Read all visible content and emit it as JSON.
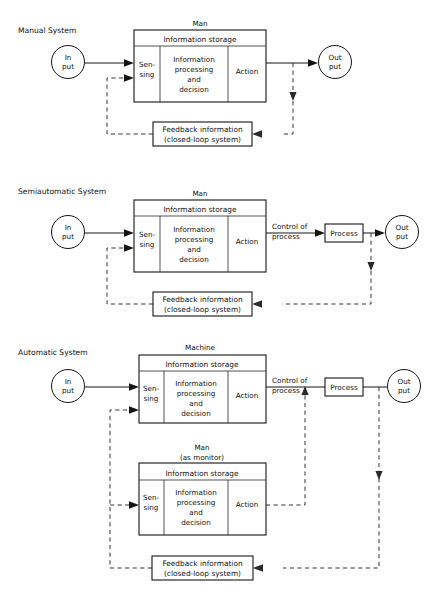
{
  "figure": {
    "title_visible": false,
    "labels": {
      "information_storage": "Information storage",
      "sensing": "Sen-\nsing",
      "sensing_line1": "Sen-",
      "sensing_line2": "sing",
      "processing_line1": "Information",
      "processing_line2": "processing",
      "processing_line3": "and",
      "processing_line4": "decision",
      "action": "Action",
      "input_line1": "In",
      "input_line2": "put",
      "output_line1": "Out",
      "output_line2": "put",
      "feedback_line1": "Feedback information",
      "feedback_line2": "(closed-loop system)",
      "control_line1": "Control of",
      "control_line2": "process",
      "process": "Process"
    }
  },
  "diagrams": [
    {
      "id": "manual-system",
      "system_label": "Manual System",
      "owner_label": "Man",
      "owner_sub_label": "",
      "storage_label": "Information storage",
      "cells": [
        {
          "id": "sensing",
          "lines": [
            "Sen-",
            "sing"
          ]
        },
        {
          "id": "processing",
          "lines": [
            "Information",
            "processing",
            "and",
            "decision"
          ]
        },
        {
          "id": "action",
          "lines": [
            "Action"
          ]
        }
      ],
      "input_node": {
        "lines": [
          "In",
          "put"
        ]
      },
      "output_node": {
        "lines": [
          "Out",
          "put"
        ]
      },
      "feedback_box": {
        "lines": [
          "Feedback information",
          "(closed-loop system)"
        ]
      },
      "has_process_block": false,
      "has_control_label": false,
      "has_monitor_block": false
    },
    {
      "id": "semiautomatic-system",
      "system_label": "Semiautomatic System",
      "owner_label": "Man",
      "owner_sub_label": "",
      "storage_label": "Information storage",
      "cells": [
        {
          "id": "sensing",
          "lines": [
            "Sen-",
            "sing"
          ]
        },
        {
          "id": "processing",
          "lines": [
            "Information",
            "processing",
            "and",
            "decision"
          ]
        },
        {
          "id": "action",
          "lines": [
            "Action"
          ]
        }
      ],
      "input_node": {
        "lines": [
          "In",
          "put"
        ]
      },
      "output_node": {
        "lines": [
          "Out",
          "put"
        ]
      },
      "feedback_box": {
        "lines": [
          "Feedback information",
          "(closed-loop system)"
        ]
      },
      "control_label": {
        "lines": [
          "Control of",
          "process"
        ]
      },
      "process_block": {
        "label": "Process"
      },
      "has_process_block": true,
      "has_control_label": true,
      "has_monitor_block": false
    },
    {
      "id": "automatic-system",
      "system_label": "Automatic System",
      "owner_label": "Machine",
      "owner_sub_label": "",
      "storage_label": "Information storage",
      "cells": [
        {
          "id": "sensing",
          "lines": [
            "Sen-",
            "sing"
          ]
        },
        {
          "id": "processing",
          "lines": [
            "Information",
            "processing",
            "and",
            "decision"
          ]
        },
        {
          "id": "action",
          "lines": [
            "Action"
          ]
        }
      ],
      "monitor": {
        "owner_label": "Man",
        "owner_sub_label": "(as monitor)",
        "storage_label": "Information storage",
        "cells": [
          {
            "id": "sensing",
            "lines": [
              "Sen-",
              "sing"
            ]
          },
          {
            "id": "processing",
            "lines": [
              "Information",
              "processing",
              "and",
              "decision"
            ]
          },
          {
            "id": "action",
            "lines": [
              "Action"
            ]
          }
        ]
      },
      "input_node": {
        "lines": [
          "In",
          "put"
        ]
      },
      "output_node": {
        "lines": [
          "Out",
          "put"
        ]
      },
      "feedback_box": {
        "lines": [
          "Feedback information",
          "(closed-loop system)"
        ]
      },
      "control_label": {
        "lines": [
          "Control of",
          "process"
        ]
      },
      "process_block": {
        "label": "Process"
      },
      "has_process_block": true,
      "has_control_label": true,
      "has_monitor_block": true
    }
  ],
  "colors": {
    "background": "#ffffff",
    "stroke": "#141414",
    "dashed_stroke": "#2a2a2a",
    "text": "#101010"
  }
}
